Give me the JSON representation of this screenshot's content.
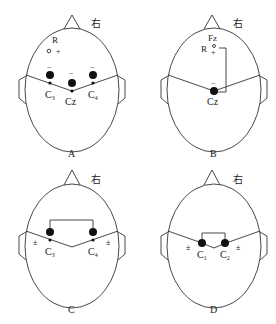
{
  "panels": [
    {
      "id": "A",
      "caption": "A",
      "right_label": "右",
      "ref_label": "R",
      "electrodes": [
        "C3",
        "Cz",
        "C4"
      ],
      "electrode_labels": {
        "c3": "C",
        "c3_sub": "3",
        "cz": "Cz",
        "c4": "C",
        "c4_sub": "4"
      },
      "signs": {
        "neg": "−",
        "plus": "+"
      }
    },
    {
      "id": "B",
      "caption": "B",
      "right_label": "右",
      "ref_label": "R",
      "fz_label": "Fz",
      "cz_label": "Cz",
      "signs": {
        "neg": "−",
        "plus": "+"
      }
    },
    {
      "id": "C",
      "caption": "C",
      "right_label": "右",
      "electrode_labels": {
        "c3": "C",
        "c3_sub": "3",
        "c4": "C",
        "c4_sub": "4"
      },
      "signs": {
        "pm": "±"
      }
    },
    {
      "id": "D",
      "caption": "D",
      "right_label": "右",
      "electrode_labels": {
        "c1": "C",
        "c1_sub": "1",
        "c2": "C",
        "c2_sub": "2"
      },
      "signs": {
        "pm": "±"
      }
    }
  ]
}
